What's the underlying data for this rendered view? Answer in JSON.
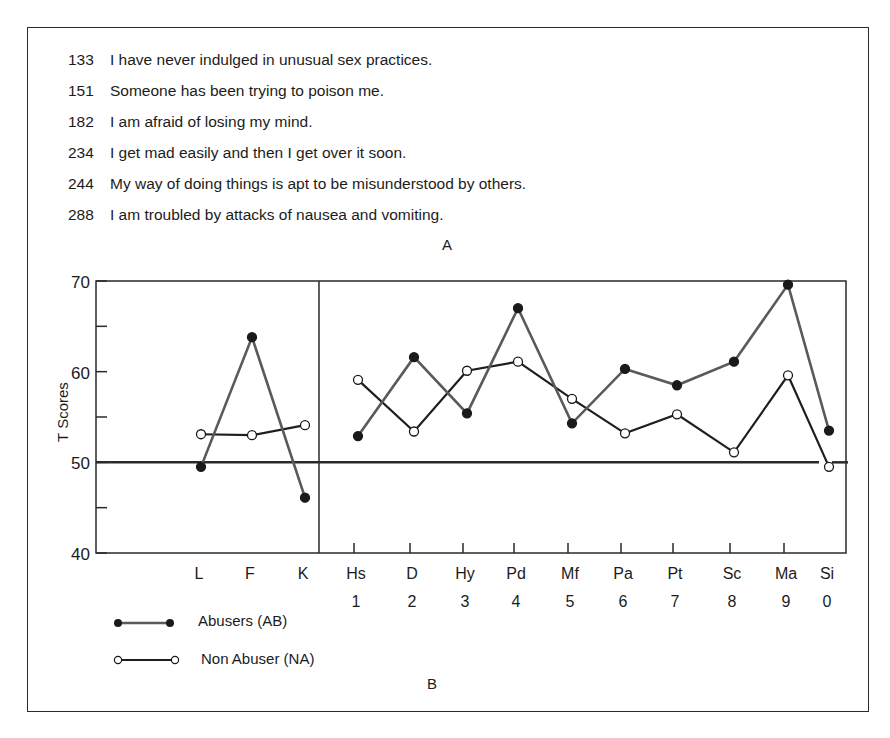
{
  "items": [
    {
      "num": "133",
      "text": "I have never indulged in unusual sex practices."
    },
    {
      "num": "151",
      "text": "Someone has been trying to poison me."
    },
    {
      "num": "182",
      "text": "I am afraid of losing my mind."
    },
    {
      "num": "234",
      "text": "I get mad easily and then I get over it soon."
    },
    {
      "num": "244",
      "text": "My way of doing things is apt to be misunderstood by others."
    },
    {
      "num": "288",
      "text": "I am troubled by attacks of nausea and vomiting."
    }
  ],
  "panel_labels": {
    "a": "A",
    "b": "B"
  },
  "colors": {
    "abusers": "#5a5a5a",
    "non_abusers": "#1e1e1e",
    "axis": "#2a2a2a"
  },
  "chart_data": {
    "type": "line",
    "title": "",
    "xlabel": "",
    "ylabel": "T Scores",
    "ylim": [
      40,
      70
    ],
    "yticks": [
      40,
      50,
      60,
      70
    ],
    "minor_yticks": [
      45,
      55,
      65
    ],
    "reference_line": 50,
    "grid": false,
    "legend_position": "bottom-left",
    "categories": [
      "L",
      "F",
      "K",
      "Hs",
      "D",
      "Hy",
      "Pd",
      "Mf",
      "Pa",
      "Pt",
      "Sc",
      "Ma",
      "Si"
    ],
    "category_numbers": [
      "",
      "",
      "",
      "1",
      "2",
      "3",
      "4",
      "5",
      "6",
      "7",
      "8",
      "9",
      "0"
    ],
    "validity_scales": [
      "L",
      "F",
      "K"
    ],
    "clinical_scales": [
      "Hs",
      "D",
      "Hy",
      "Pd",
      "Mf",
      "Pa",
      "Pt",
      "Sc",
      "Ma",
      "Si"
    ],
    "series": [
      {
        "name": "Abusers (AB)",
        "marker": "filled-circle",
        "values": [
          49.5,
          63.8,
          46.1,
          52.9,
          61.6,
          55.4,
          67.0,
          54.3,
          60.3,
          58.5,
          61.1,
          69.6,
          53.5
        ]
      },
      {
        "name": "Non Abuser (NA)",
        "marker": "open-circle",
        "values": [
          53.1,
          53.0,
          54.1,
          59.1,
          53.4,
          60.1,
          61.1,
          57.0,
          53.2,
          55.3,
          51.1,
          59.6,
          49.5
        ]
      }
    ]
  }
}
